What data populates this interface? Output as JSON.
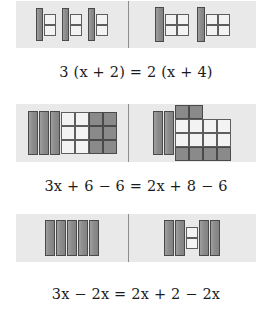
{
  "figure": {
    "colors": {
      "panel_background": "#e9e9e9",
      "tile_dark": "#8a8a8a",
      "tile_dark_border": "#4a4a4a",
      "tile_light": "#f3f3f3",
      "tile_light_border": "#5e5e5e",
      "divider": "#8d8d8d",
      "text": "#1b1b1b",
      "page_background": "#ffffff"
    }
  },
  "steps": [
    {
      "id": "step-1",
      "equation": {
        "lhs": "3 (x + 2)",
        "rhs": "2 (x + 4)",
        "relation": "=",
        "text": "3 (x + 2) = 2 (x + 4)"
      },
      "balance": {
        "left": {
          "groups": [
            {
              "x_bars": 1,
              "light_units": 2,
              "dark_units": 0
            },
            {
              "x_bars": 1,
              "light_units": 2,
              "dark_units": 0
            },
            {
              "x_bars": 1,
              "light_units": 2,
              "dark_units": 0
            }
          ],
          "total_x": 3,
          "total_units": 6
        },
        "right": {
          "groups": [
            {
              "x_bars": 1,
              "light_units": 4,
              "dark_units": 0
            },
            {
              "x_bars": 1,
              "light_units": 4,
              "dark_units": 0
            }
          ],
          "total_x": 2,
          "total_units": 8
        }
      }
    },
    {
      "id": "step-2",
      "equation": {
        "lhs": "3x + 6 − 6",
        "rhs": "2x + 8 − 6",
        "relation": "=",
        "text": "3x + 6 − 6 = 2x + 8 − 6"
      },
      "balance": {
        "left": {
          "x_bars": 3,
          "light_units": 6,
          "dark_units": 6,
          "light_grid": {
            "cols": 2,
            "rows": 3
          },
          "dark_grid": {
            "cols": 2,
            "rows": 3
          }
        },
        "right": {
          "x_bars": 2,
          "light_units": 8,
          "dark_units": 6,
          "light_grid": {
            "cols": 4,
            "rows": 2
          },
          "dark_top_row": 2,
          "dark_bottom_row": 4
        }
      }
    },
    {
      "id": "step-3",
      "equation": {
        "lhs": "3x − 2x",
        "rhs": "2x + 2 − 2x",
        "relation": "=",
        "text": "3x − 2x = 2x + 2 − 2x"
      },
      "balance": {
        "left": {
          "x_bars": 5,
          "light_units": 0
        },
        "right": {
          "x_bars_before": 2,
          "light_units": 2,
          "x_bars_after": 2
        }
      }
    }
  ]
}
